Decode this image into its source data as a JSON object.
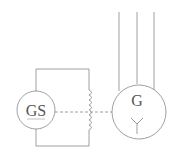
{
  "diagram": {
    "title": "",
    "exciter": {
      "label": "GS",
      "type": "generator"
    },
    "main_generator": {
      "label": "G",
      "winding_symbol": "Y",
      "type": "three-phase generator, star connected"
    },
    "field_winding": {
      "type": "inductor coil"
    },
    "shaft_link": {
      "style": "dashed",
      "connects": [
        "GS",
        "field winding",
        "G"
      ]
    },
    "output_lines": 3,
    "colors": {
      "stroke": "#777777",
      "background": "#ffffff"
    }
  }
}
